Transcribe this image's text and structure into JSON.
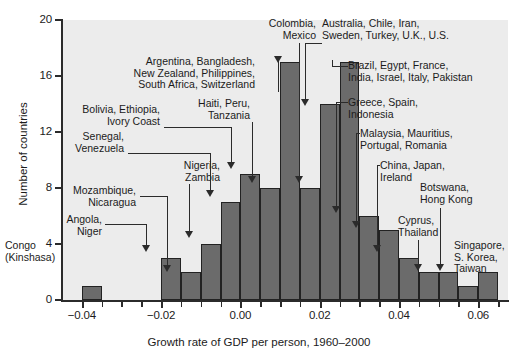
{
  "chart_data": {
    "type": "bar",
    "title": "",
    "xlabel": "Growth rate of GDP per person, 1960–2000",
    "ylabel": "Number of countries",
    "xlim": [
      -0.045,
      0.0675
    ],
    "ylim": [
      0,
      20
    ],
    "grid": false,
    "legend": "none",
    "bin_width": 0.005,
    "categories": [
      "-0.040",
      "-0.035",
      "-0.030",
      "-0.025",
      "-0.020",
      "-0.015",
      "-0.010",
      "-0.005",
      "0.000",
      "0.005",
      "0.010",
      "0.015",
      "0.020",
      "0.025",
      "0.030",
      "0.035",
      "0.040",
      "0.045",
      "0.050",
      "0.055",
      "0.060"
    ],
    "bin_starts": [
      -0.04,
      -0.035,
      -0.03,
      -0.025,
      -0.02,
      -0.015,
      -0.01,
      -0.005,
      0.0,
      0.005,
      0.01,
      0.015,
      0.02,
      0.025,
      0.03,
      0.035,
      0.04,
      0.045,
      0.05,
      0.055,
      0.06
    ],
    "values": [
      1,
      0,
      0,
      0,
      3,
      2,
      4,
      7,
      9,
      8,
      17,
      8,
      14,
      17,
      6,
      5,
      3,
      2,
      2,
      1,
      2
    ],
    "xticks": [
      -0.04,
      -0.02,
      0.0,
      0.02,
      0.04,
      0.06
    ],
    "xtick_labels": [
      "−0.04",
      "−0.02",
      "0.00",
      "0.02",
      "0.04",
      "0.06"
    ],
    "yticks": [
      0,
      4,
      8,
      12,
      16,
      20
    ],
    "ytick_labels": [
      "0",
      "4",
      "8",
      "12",
      "16",
      "20"
    ],
    "bar_color": "#6b6b6b",
    "plot_background": "#ececec",
    "annotations": [
      {
        "text": "Congo\n(Kinshasa)",
        "bin_start": -0.04,
        "value": 1
      },
      {
        "text": "Angola,\nNiger",
        "bin_start": -0.02,
        "value": 3
      },
      {
        "text": "Mozambique,\nNicaragua",
        "bin_start": -0.015,
        "value": 2
      },
      {
        "text": "Nigeria,\nZambia",
        "bin_start": -0.01,
        "value": 4
      },
      {
        "text": "Senegal,\nVenezuela",
        "bin_start": -0.005,
        "value": 7
      },
      {
        "text": "Bolivia, Ethiopia,\nIvory Coast",
        "bin_start": 0.0,
        "value": 9
      },
      {
        "text": "Haiti, Peru,\nTanzania",
        "bin_start": 0.005,
        "value": 8
      },
      {
        "text": "Argentina, Bangladesh,\nNew Zealand, Philippines,\nSouth Africa, Switzerland",
        "bin_start": 0.01,
        "value": 17
      },
      {
        "text": "Colombia,\nMexico",
        "bin_start": 0.015,
        "value": 8
      },
      {
        "text": "Australia, Chile, Iran,\nSweden, Turkey, U.K., U.S.",
        "bin_start": 0.02,
        "value": 14
      },
      {
        "text": "Brazil, Egypt, France,\nIndia, Israel, Italy, Pakistan",
        "bin_start": 0.025,
        "value": 17
      },
      {
        "text": "Greece, Spain,\nIndonesia",
        "bin_start": 0.03,
        "value": 6
      },
      {
        "text": "Malaysia, Mauritius,\nPortugal, Romania",
        "bin_start": 0.035,
        "value": 5
      },
      {
        "text": "China, Japan,\nIreland",
        "bin_start": 0.04,
        "value": 3
      },
      {
        "text": "Cyprus,\nThailand",
        "bin_start": 0.045,
        "value": 2
      },
      {
        "text": "Botswana,\nHong Kong",
        "bin_start": 0.05,
        "value": 2
      },
      {
        "text": "Singapore,\nS. Korea,\nTaiwan",
        "bin_start": 0.06,
        "value": 2
      }
    ]
  },
  "labels": {
    "ytick_0": "0",
    "ytick_4": "4",
    "ytick_8": "8",
    "ytick_12": "12",
    "ytick_16": "16",
    "ytick_20": "20",
    "xtick_m04": "−0.04",
    "xtick_m02": "−0.02",
    "xtick_000": "0.00",
    "xtick_002": "0.02",
    "xtick_004": "0.04",
    "xtick_006": "0.06",
    "x_axis_title": "Growth rate of GDP per person, 1960–2000",
    "y_axis_title": "Number of countries"
  },
  "annotation_text": {
    "congo": "Congo\n(Kinshasa)",
    "angola": "Angola,\nNiger",
    "mozambique": "Mozambique,\nNicaragua",
    "nigeria": "Nigeria,\nZambia",
    "senegal": "Senegal,\nVenezuela",
    "bolivia": "Bolivia, Ethiopia,\nIvory Coast",
    "haiti": "Haiti, Peru,\nTanzania",
    "argentina": "Argentina, Bangladesh,\nNew Zealand, Philippines,\nSouth Africa, Switzerland",
    "colombia": "Colombia,\nMexico",
    "australia": "Australia, Chile, Iran,\nSweden, Turkey, U.K., U.S.",
    "brazil": "Brazil, Egypt, France,\nIndia, Israel, Italy, Pakistan",
    "greece": "Greece, Spain,\nIndonesia",
    "malaysia": "Malaysia, Mauritius,\nPortugal, Romania",
    "china": "China, Japan,\nIreland",
    "cyprus": "Cyprus,\nThailand",
    "botswana": "Botswana,\nHong Kong",
    "singapore": "Singapore,\nS. Korea,\nTaiwan"
  }
}
